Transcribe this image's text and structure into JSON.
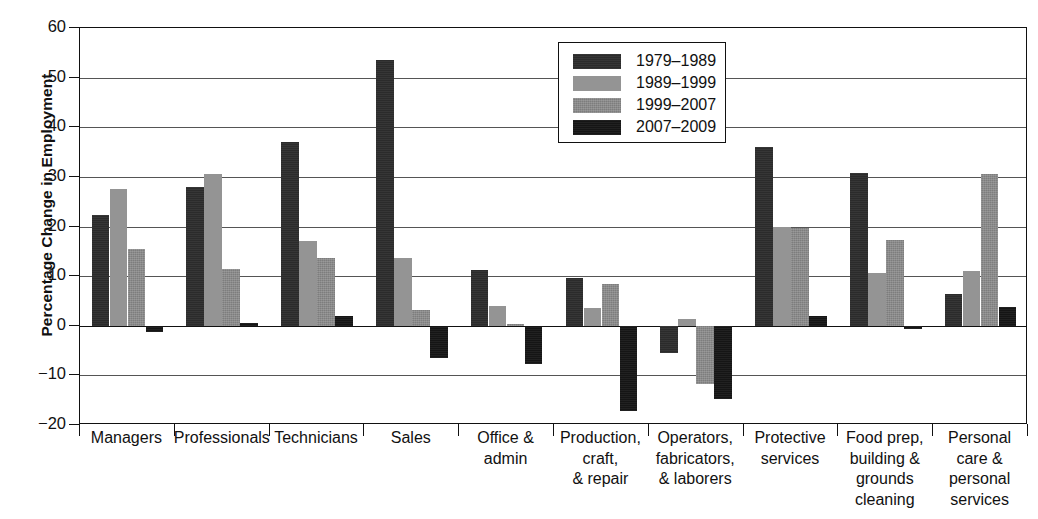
{
  "chart_data": {
    "type": "bar",
    "title": "",
    "xlabel": "",
    "ylabel": "Percentage Change in Employment",
    "ylim": [
      -20,
      60
    ],
    "yticks": [
      60,
      50,
      40,
      30,
      20,
      10,
      0,
      -10,
      -20
    ],
    "ytick_labels": [
      "60",
      "50",
      "40",
      "30",
      "20",
      "10",
      "0",
      "−10",
      "−20"
    ],
    "grid": true,
    "legend_position": "top-center",
    "categories": [
      "Managers",
      "Professionals",
      "Technicians",
      "Sales",
      "Office &\nadmin",
      "Production,\ncraft,\n& repair",
      "Operators,\nfabricators,\n& laborers",
      "Protective\nservices",
      "Food prep,\nbuilding &\ngrounds\ncleaning",
      "Personal\ncare &\npersonal\nservices"
    ],
    "series": [
      {
        "name": "1979–1989",
        "color": "#2b2b2b",
        "values": [
          22.4,
          27.9,
          37.1,
          53.5,
          11.3,
          9.7,
          -5.5,
          36.0,
          30.7,
          6.4
        ]
      },
      {
        "name": "1989–1999",
        "color": "#949494",
        "values": [
          27.6,
          30.5,
          17.0,
          13.7,
          3.9,
          3.5,
          1.4,
          20.0,
          10.7,
          11.0
        ]
      },
      {
        "name": "1999–2007",
        "color": "#7d7d7d",
        "values": [
          15.4,
          11.4,
          13.7,
          3.2,
          0.3,
          8.5,
          -11.8,
          19.6,
          17.2,
          30.6
        ]
      },
      {
        "name": "2007–2009",
        "color": "#151515",
        "values": [
          -1.2,
          0.5,
          2.0,
          -6.5,
          -7.8,
          -17.2,
          -14.8,
          2.0,
          -0.6,
          3.7
        ]
      }
    ]
  },
  "axis": {
    "y_title": "Percentage Change in Employment"
  }
}
